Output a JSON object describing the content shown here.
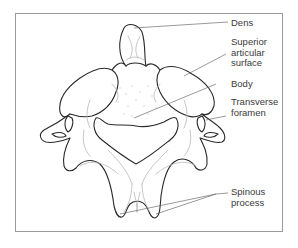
{
  "figure": {
    "labels": [
      {
        "id": "dens",
        "lines": [
          "Dens"
        ]
      },
      {
        "id": "superior-articular-surface",
        "lines": [
          "Superior",
          "articular",
          "surface"
        ]
      },
      {
        "id": "body",
        "lines": [
          "Body"
        ]
      },
      {
        "id": "transverse-foramen",
        "lines": [
          "Transverse",
          "foramen"
        ]
      },
      {
        "id": "spinous-process",
        "lines": [
          "Spinous",
          "process"
        ]
      }
    ]
  },
  "colors": {
    "outline": "#2a2a2a",
    "detail": "#b8b8b8",
    "frame": "#9a9a9a",
    "text": "#3a3a3a"
  }
}
